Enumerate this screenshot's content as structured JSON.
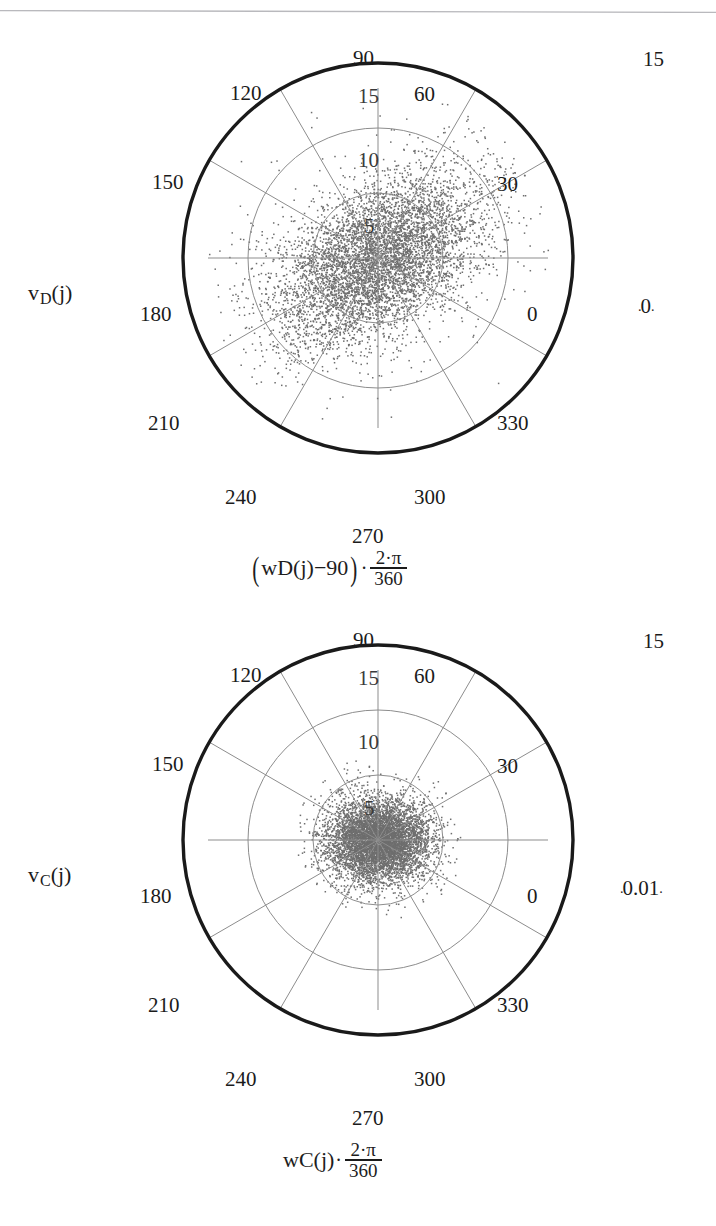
{
  "page": {
    "background": "#ffffff",
    "ink": "#1b1b1b",
    "grid_color": "#8a8a8a",
    "frame_color": "#1a1a1a",
    "marker_color": "#6e6e6e",
    "rule_color": "#b9b9bd"
  },
  "plots": [
    {
      "id": "plot-d",
      "y_axis_label": {
        "base": "v",
        "sub": "D",
        "arg": "(j)"
      },
      "x_axis_formula": {
        "open_paren": "(",
        "base": "w",
        "sub": "D",
        "arg": "(j)",
        "offset": "−90",
        "close_paren": ")",
        "dot": "·",
        "numerator": "2·π",
        "denominator": "360",
        "plain": "(w_D(j)−90)·(2·π/360)"
      },
      "radial_max_label": "15",
      "radial_min_label": "0",
      "angle_labels": [
        "0",
        "30",
        "60",
        "90",
        "120",
        "150",
        "180",
        "210",
        "240",
        "270",
        "300",
        "330"
      ],
      "radial_tick_labels": [
        "5",
        "10",
        "15"
      ],
      "chart_data": {
        "type": "scatter",
        "coordinate_system": "polar",
        "title": "",
        "xlabel": "(w_D(j)−90)·2·π/360",
        "ylabel": "v_D(j)",
        "rlim": [
          0,
          15
        ],
        "rticks": [
          5,
          10,
          15
        ],
        "theta_ticks_deg": [
          0,
          30,
          60,
          90,
          120,
          150,
          180,
          210,
          240,
          270,
          300,
          330
        ],
        "theta_direction": "counterclockwise",
        "theta_zero_location": "E",
        "grid": true,
        "legend": null,
        "n_points": 6000,
        "cloud": {
          "shape": "elongated-elliptical",
          "major_axis_orientation_deg": 35,
          "center_r": 0.0,
          "sigma_major": 4.6,
          "sigma_minor": 2.6,
          "outlier_fraction": 0.05,
          "max_radius_reached": 13.5,
          "note": "Dense diagonal blob from lower-left (~215°) to upper-right (~35°), core fills the r<5 circle and spills past r=10 along the major axis."
        }
      }
    },
    {
      "id": "plot-c",
      "y_axis_label": {
        "base": "v",
        "sub": "C",
        "arg": "(j)"
      },
      "x_axis_formula": {
        "open_paren": "",
        "base": "w",
        "sub": "C",
        "arg": "(j)",
        "offset": "",
        "close_paren": "",
        "dot": "·",
        "numerator": "2·π",
        "denominator": "360",
        "plain": "w_C(j)·(2·π/360)"
      },
      "radial_max_label": "15",
      "radial_min_label": "0.01",
      "angle_labels": [
        "0",
        "30",
        "60",
        "90",
        "120",
        "150",
        "180",
        "210",
        "240",
        "270",
        "300",
        "330"
      ],
      "radial_tick_labels": [
        "5",
        "10",
        "15"
      ],
      "chart_data": {
        "type": "scatter",
        "coordinate_system": "polar",
        "title": "",
        "xlabel": "w_C(j)·2·π/360",
        "ylabel": "v_C(j)",
        "rlim": [
          0,
          15
        ],
        "rticks": [
          5,
          10,
          15
        ],
        "theta_ticks_deg": [
          0,
          30,
          60,
          90,
          120,
          150,
          180,
          210,
          240,
          270,
          300,
          330
        ],
        "theta_direction": "counterclockwise",
        "theta_zero_location": "E",
        "grid": true,
        "legend": null,
        "n_points": 6000,
        "cloud": {
          "shape": "compact-round",
          "major_axis_orientation_deg": 0,
          "center_r": 0.0,
          "sigma_major": 2.0,
          "sigma_minor": 1.6,
          "outlier_fraction": 0.02,
          "max_radius_reached": 6.5,
          "note": "Tight roughly circular blob confined inside the r=5 gridline, slightly wider horizontally; a thin scatter of stray points out to r≈6."
        }
      }
    }
  ]
}
